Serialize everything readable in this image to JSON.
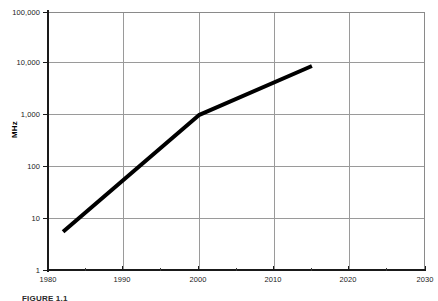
{
  "figure": {
    "caption": "FIGURE 1.1",
    "background_color": "#ffffff",
    "line_color": "#000000",
    "grid_color": "#9a9a9a",
    "axis_color": "#1a1a1a"
  },
  "chart_data": {
    "type": "line",
    "title": "",
    "xlabel": "",
    "ylabel": "MHz",
    "xlim": [
      1980,
      2030
    ],
    "ylim": [
      1,
      100000
    ],
    "yscale": "log",
    "xscale": "linear",
    "grid": true,
    "legend": "none",
    "x_ticks": [
      1980,
      1990,
      2000,
      2010,
      2020,
      2030
    ],
    "x_tick_labels": [
      "1980",
      "1990",
      "2000",
      "2010",
      "2020",
      "2030"
    ],
    "x_minor_ticks": [
      1985,
      1995,
      2005,
      2015,
      2025
    ],
    "y_ticks": [
      1,
      10,
      100,
      1000,
      10000,
      100000
    ],
    "y_tick_labels": [
      "1",
      "10",
      "100",
      "1,000",
      "10,000",
      "100,000"
    ],
    "series": [
      {
        "name": "Processor clock frequency",
        "x": [
          1982,
          2000,
          2015
        ],
        "y": [
          5.5,
          1000,
          9000
        ],
        "linewidth": 4,
        "color": "#000000"
      }
    ]
  }
}
